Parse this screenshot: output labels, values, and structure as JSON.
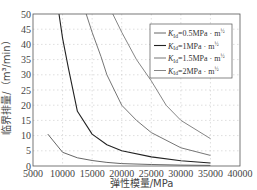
{
  "chart_data": {
    "type": "line",
    "title": "",
    "xlabel": "弹性模量/MPa",
    "ylabel": "临界排量/（m³/min）",
    "xlim": [
      5000,
      40000
    ],
    "ylim": [
      0,
      50
    ],
    "xticks": [
      5000,
      10000,
      15000,
      20000,
      25000,
      30000,
      35000,
      40000
    ],
    "yticks": [
      0,
      5,
      10,
      15,
      20,
      25,
      30,
      35,
      40,
      45,
      50
    ],
    "grid": true,
    "grid_style": "dotted",
    "legend_position": "upper right",
    "series": [
      {
        "name": "K_Id=0.5MPa·m^1/2",
        "label_parts": {
          "sym": "K",
          "sub": "Id",
          "rest": "=0.5MPa · m",
          "sup": "½"
        },
        "color": "#555555",
        "x": [
          7500,
          10000,
          12500,
          15000,
          17500,
          20000,
          25000,
          30000,
          35000
        ],
        "y": [
          10.5,
          4.5,
          2.7,
          1.8,
          1.2,
          0.8,
          0.5,
          0.3,
          0.2
        ]
      },
      {
        "name": "K_Id=1MPa·m^1/2",
        "label_parts": {
          "sym": "K",
          "sub": "Id",
          "rest": "=1MPa · m",
          "sup": "½"
        },
        "color": "#222222",
        "x": [
          9400,
          10000,
          11000,
          12500,
          15000,
          17500,
          20000,
          25000,
          30000,
          35000
        ],
        "y": [
          50,
          42,
          32,
          18,
          10.5,
          7,
          5,
          3,
          1.7,
          1
        ]
      },
      {
        "name": "K_Id=1.5MPa·m^1/2",
        "label_parts": {
          "sym": "K",
          "sub": "Id",
          "rest": "=1.5MPa · m",
          "sup": "½"
        },
        "color": "#666666",
        "x": [
          14000,
          15000,
          16500,
          17500,
          20000,
          22500,
          25000,
          30000,
          35000
        ],
        "y": [
          50,
          44,
          36,
          30,
          20,
          15,
          11,
          6,
          3.5
        ]
      },
      {
        "name": "K_Id=2MPa·m^1/2",
        "label_parts": {
          "sym": "K",
          "sub": "Id",
          "rest": "=2MPa · m",
          "sup": "½"
        },
        "color": "#777777",
        "x": [
          18500,
          20000,
          22500,
          25000,
          27500,
          30000,
          35000
        ],
        "y": [
          50,
          44,
          35,
          28,
          20,
          15,
          9
        ]
      }
    ]
  }
}
